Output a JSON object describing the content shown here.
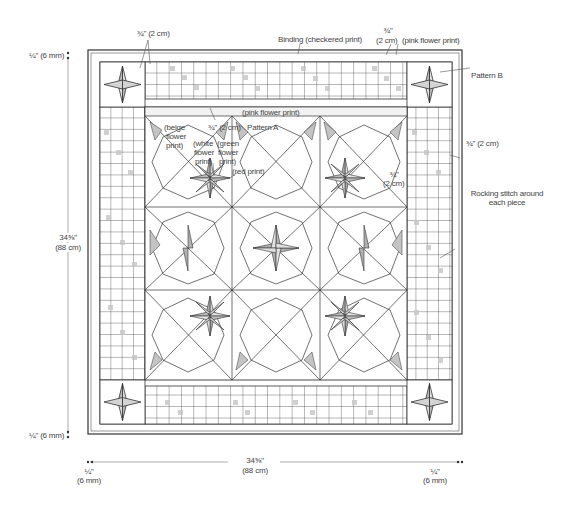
{
  "diagram": {
    "colors": {
      "line": "#333333",
      "shade_light": "#e4e4e4",
      "shade_mid": "#c8c8c8",
      "shade_dark": "#a6a6a6"
    }
  },
  "labels": {
    "top_seam": "¾\" (2 cm)",
    "binding": "Binding (checkered print)",
    "top_right_seam_1": "¾\"",
    "top_right_seam_2": "(2 cm)",
    "pink_flower_top": "(pink flower print)",
    "pattern_b": "Pattern B",
    "pink_flower_strip": "(pink flower print)",
    "inner_seam": "¾\" (2 cm)",
    "pattern_a": "Pattern A",
    "beige_1": "(beige",
    "beige_2": "flower",
    "beige_3": "print)",
    "white_1": "(white",
    "white_2": "flower",
    "white_3": "print)",
    "green_1": "(green",
    "green_2": "flower",
    "green_3": "print)",
    "red": "(red print)",
    "right_seam": "¾\" (2 cm)",
    "center_seam_1": "¾\"",
    "center_seam_2": "(2 cm)",
    "rocking_1": "Rocking stitch around",
    "rocking_2": "each piece",
    "left_height_1": "34⅝\"",
    "left_height_2": "(88 cm)",
    "top_margin": "¼\" (6 mm)",
    "bottom_margin": "¼\" (6 mm)",
    "bottom_width_1": "34⅝\"",
    "bottom_width_2": "(88 cm)",
    "bottom_left_1": "¼\"",
    "bottom_left_2": "(6 mm)",
    "bottom_right_1": "¼\"",
    "bottom_right_2": "(6 mm)"
  },
  "dimensions": {
    "overall_height": "34⅝\" (88 cm)",
    "overall_width": "34⅝\" (88 cm)",
    "binding_margin": "¼\" (6 mm)",
    "seam_allowance": "¾\" (2 cm)"
  }
}
